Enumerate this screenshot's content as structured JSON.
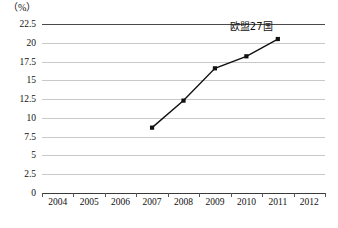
{
  "chart_data": {
    "type": "line",
    "title": "",
    "subtitle": "",
    "unit_label": "（%）",
    "xlabel": "",
    "ylabel": "",
    "x_tick_labels": [
      "2004",
      "2005",
      "2006",
      "2007",
      "2008",
      "2009",
      "2010",
      "2011",
      "2012"
    ],
    "y_tick_labels": [
      "0",
      "2.5",
      "5",
      "7.5",
      "10",
      "12.5",
      "15",
      "17.5",
      "20",
      "22.5"
    ],
    "y_tick_values": [
      0,
      2.5,
      5,
      7.5,
      10,
      12.5,
      15,
      17.5,
      20,
      22.5
    ],
    "ylim": [
      0,
      22.5
    ],
    "grid": "horizontal",
    "legend_position": "inline-annotation",
    "series": [
      {
        "name": "欧盟27国",
        "x": [
          "2007",
          "2008",
          "2009",
          "2010",
          "2011"
        ],
        "values": [
          8.7,
          12.3,
          16.6,
          18.2,
          20.5
        ],
        "marker": "square",
        "color": "#111111",
        "annotation": "欧盟27国"
      }
    ]
  },
  "annotations": {
    "series_label": "欧盟27国"
  },
  "colors": {
    "line": "#111111",
    "gridline": "#c9c9c9",
    "axis": "#3a3a3a",
    "text": "#111111",
    "background": "#ffffff"
  }
}
